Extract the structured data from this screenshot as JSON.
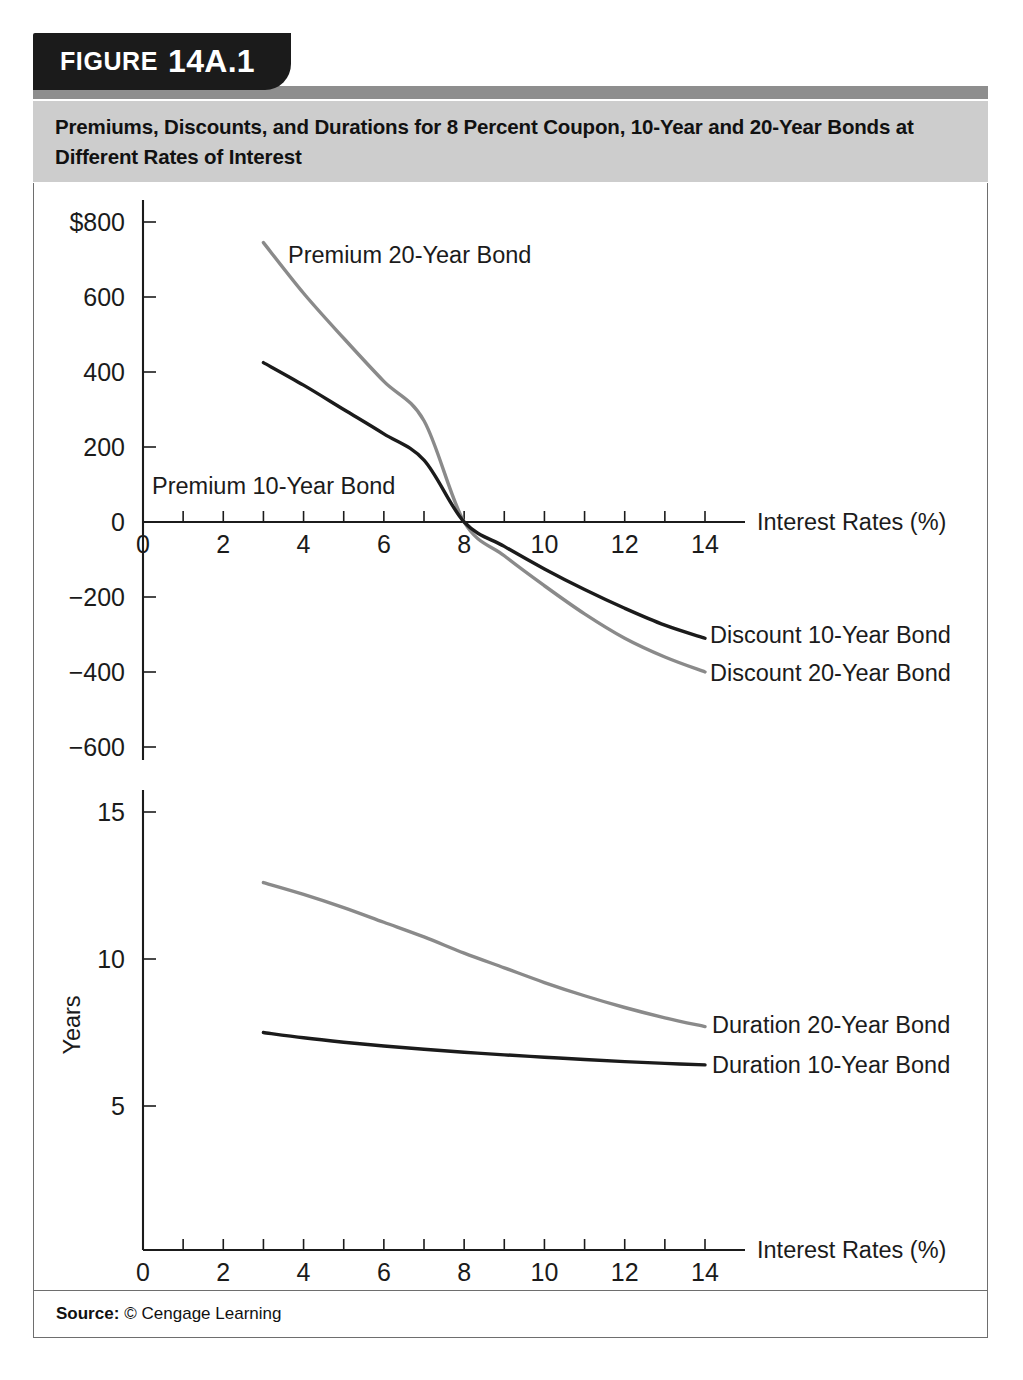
{
  "figure": {
    "label": "FIGURE",
    "number": "14A.1",
    "caption": "Premiums, Discounts, and Durations for 8 Percent Coupon, 10-Year and 20-Year Bonds at Different Rates of Interest",
    "source_label": "Source:",
    "source_value": "© Cengage Learning"
  },
  "colors": {
    "tab_background": "#1b1b1b",
    "tab_text": "#ffffff",
    "header_strip": "#8e8e8e",
    "caption_band": "#cdcdcd",
    "frame_border": "#6e6e6e",
    "series_dark": "#1b1b1b",
    "series_gray": "#8a8a8a",
    "page_background": "#ffffff"
  },
  "chart_data": [
    {
      "id": "premium-discount-chart",
      "type": "line",
      "title": "",
      "xlabel": "Interest Rates (%)",
      "ylabel": "",
      "xlim": [
        0,
        15
      ],
      "ylim": [
        -700,
        850
      ],
      "grid": false,
      "legend_position": "inline-annotations",
      "xticks": [
        0,
        1,
        2,
        3,
        4,
        5,
        6,
        7,
        8,
        9,
        10,
        11,
        12,
        13,
        14
      ],
      "xtick_labels": [
        "0",
        "",
        "2",
        "",
        "4",
        "",
        "6",
        "",
        "8",
        "",
        "10",
        "",
        "12",
        "",
        "14"
      ],
      "yticks": [
        800,
        600,
        400,
        200,
        0,
        -200,
        -400,
        -600
      ],
      "ytick_labels": [
        "$800",
        "600",
        "400",
        "200",
        "0",
        "−200",
        "−400",
        "−600"
      ],
      "x": [
        3,
        4,
        5,
        6,
        7,
        8,
        9,
        10,
        11,
        12,
        13,
        14
      ],
      "series": [
        {
          "name": "Premium 20-Year Bond",
          "annotation": "Premium 20-Year Bond",
          "color": "#8a8a8a",
          "values": [
            745,
            610,
            490,
            375,
            270,
            0,
            -90,
            -170,
            -245,
            -310,
            -360,
            -400
          ]
        },
        {
          "name": "Premium 10-Year Bond",
          "annotation": "Premium 10-Year Bond",
          "color": "#1b1b1b",
          "values": [
            425,
            365,
            300,
            235,
            165,
            0,
            -65,
            -125,
            -180,
            -230,
            -275,
            -310
          ]
        }
      ],
      "annotations": [
        {
          "text": "Premium 20-Year Bond",
          "series": "Premium 20-Year Bond"
        },
        {
          "text": "Premium 10-Year Bond",
          "series": "Premium 10-Year Bond"
        },
        {
          "text": "Discount 10-Year Bond",
          "series": "Premium 10-Year Bond"
        },
        {
          "text": "Discount 20-Year Bond",
          "series": "Premium 20-Year Bond"
        }
      ]
    },
    {
      "id": "duration-chart",
      "type": "line",
      "title": "",
      "xlabel": "Interest Rates (%)",
      "ylabel": "Years",
      "xlim": [
        0,
        15
      ],
      "ylim": [
        0,
        16
      ],
      "grid": false,
      "legend_position": "inline-annotations",
      "xticks": [
        0,
        1,
        2,
        3,
        4,
        5,
        6,
        7,
        8,
        9,
        10,
        11,
        12,
        13,
        14
      ],
      "xtick_labels": [
        "0",
        "",
        "2",
        "",
        "4",
        "",
        "6",
        "",
        "8",
        "",
        "10",
        "",
        "12",
        "",
        "14"
      ],
      "yticks": [
        15,
        10,
        5
      ],
      "ytick_labels": [
        "15",
        "10",
        "5"
      ],
      "x": [
        3,
        4,
        5,
        6,
        7,
        8,
        9,
        10,
        11,
        12,
        13,
        14
      ],
      "series": [
        {
          "name": "Duration 20-Year Bond",
          "annotation": "Duration 20-Year Bond",
          "color": "#8a8a8a",
          "values": [
            12.6,
            12.2,
            11.75,
            11.25,
            10.75,
            10.2,
            9.7,
            9.2,
            8.75,
            8.35,
            8.0,
            7.7
          ]
        },
        {
          "name": "Duration 10-Year Bond",
          "annotation": "Duration 10-Year Bond",
          "color": "#1b1b1b",
          "values": [
            7.5,
            7.32,
            7.17,
            7.04,
            6.93,
            6.83,
            6.74,
            6.66,
            6.58,
            6.51,
            6.45,
            6.4
          ]
        }
      ],
      "annotations": [
        {
          "text": "Duration 20-Year Bond",
          "series": "Duration 20-Year Bond"
        },
        {
          "text": "Duration 10-Year Bond",
          "series": "Duration 10-Year Bond"
        }
      ]
    }
  ]
}
